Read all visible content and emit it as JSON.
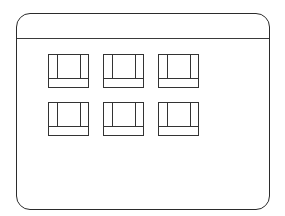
{
  "window": {
    "title": "",
    "line_color": "#2b2b2b",
    "background": "#ffffff"
  },
  "icon_grid": {
    "rows": 2,
    "columns": 3,
    "icons": [
      {
        "id": "icon-1",
        "label": ""
      },
      {
        "id": "icon-2",
        "label": ""
      },
      {
        "id": "icon-3",
        "label": ""
      },
      {
        "id": "icon-4",
        "label": ""
      },
      {
        "id": "icon-5",
        "label": ""
      },
      {
        "id": "icon-6",
        "label": ""
      }
    ]
  }
}
